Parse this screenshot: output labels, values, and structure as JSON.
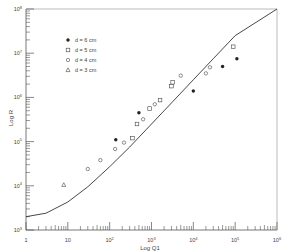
{
  "chart_data": {
    "type": "scatter",
    "title": "",
    "xlabel": "Log Q1",
    "ylabel": "Log R",
    "xscale": "log",
    "yscale": "log",
    "xlim": [
      1,
      1000000
    ],
    "ylim": [
      1000,
      100000000
    ],
    "x_ticks": [
      "1",
      "10",
      "10^2",
      "10^3",
      "10^4",
      "10^5",
      "10^6"
    ],
    "y_ticks": [
      "10^3",
      "10^4",
      "10^5",
      "10^6",
      "10^7",
      "10^8"
    ],
    "grid": false,
    "legend_position": "upper-left inside",
    "legend": [
      {
        "label": "d = 6 cm",
        "marker": "filled-circle"
      },
      {
        "label": "d = 5 cm",
        "marker": "open-square"
      },
      {
        "label": "d = 4 cm",
        "marker": "open-circle"
      },
      {
        "label": "d = 3 cm",
        "marker": "open-triangle"
      }
    ],
    "series": [
      {
        "name": "d = 6 cm",
        "marker": "filled-circle",
        "points": [
          [
            140,
            110000
          ],
          [
            500,
            450000
          ],
          [
            10000,
            1400000
          ],
          [
            50000,
            5000000
          ],
          [
            110000,
            7500000
          ]
        ]
      },
      {
        "name": "d = 5 cm",
        "marker": "open-square",
        "points": [
          [
            350,
            120000
          ],
          [
            450,
            250000
          ],
          [
            900,
            560000
          ],
          [
            1600,
            870000
          ],
          [
            3000,
            1800000
          ],
          [
            90000,
            14000000
          ],
          [
            3200,
            2200000
          ]
        ]
      },
      {
        "name": "d = 4 cm",
        "marker": "open-circle",
        "points": [
          [
            30,
            24000
          ],
          [
            60,
            38000
          ],
          [
            135,
            68000
          ],
          [
            220,
            95000
          ],
          [
            630,
            320000
          ],
          [
            1200,
            700000
          ],
          [
            5000,
            3100000
          ],
          [
            20000,
            3500000
          ],
          [
            25000,
            4800000
          ]
        ]
      },
      {
        "name": "d = 3 cm",
        "marker": "open-triangle",
        "points": [
          [
            8,
            10500
          ]
        ]
      }
    ],
    "curve": {
      "description": "theoretical fit curve",
      "points": [
        [
          1,
          2000
        ],
        [
          3,
          2400
        ],
        [
          10,
          4300
        ],
        [
          30,
          9500
        ],
        [
          100,
          27000
        ],
        [
          300,
          75000
        ],
        [
          1000,
          250000
        ],
        [
          3000,
          750000
        ],
        [
          10000,
          2500000
        ],
        [
          30000,
          7500000
        ],
        [
          100000,
          25000000
        ],
        [
          1000000,
          100000000
        ]
      ]
    }
  }
}
